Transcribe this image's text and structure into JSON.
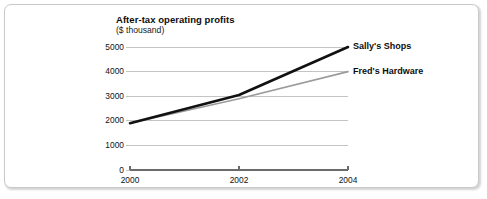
{
  "chart_data": {
    "type": "line",
    "title": "After-tax operating profits",
    "subtitle": "($ thousand)",
    "xlabel": "",
    "ylabel": "",
    "x": [
      2000,
      2002,
      2004
    ],
    "xticklabels": [
      "2000",
      "2002",
      "2004"
    ],
    "yticks": [
      0,
      1000,
      2000,
      3000,
      4000,
      5000
    ],
    "yticklabels": [
      "0",
      "1000",
      "2000",
      "3000",
      "4000",
      "5000"
    ],
    "ylim": [
      0,
      5000
    ],
    "xlim": [
      2000,
      2004
    ],
    "grid": "horizontal",
    "legend_position": "right-of-line-ends",
    "series": [
      {
        "name": "Sally's Shops",
        "values": [
          1900,
          3050,
          5000
        ],
        "color": "#111111",
        "line_width": 2.6
      },
      {
        "name": "Fred's Hardware",
        "values": [
          1900,
          2900,
          4000
        ],
        "color": "#9b9b9b",
        "line_width": 1.6
      }
    ]
  },
  "axis": {
    "gridline_color": "#c4c4c4",
    "axis_color": "#6b6b6b"
  }
}
